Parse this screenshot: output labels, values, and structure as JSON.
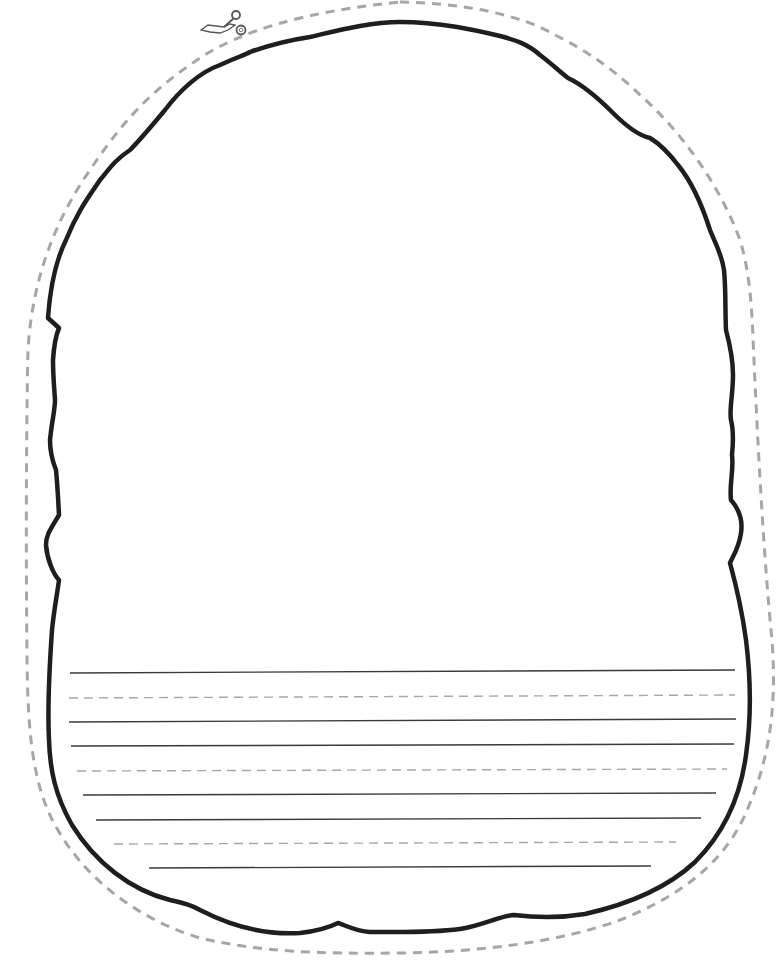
{
  "worksheet": {
    "title": "Cut-out writing template",
    "colors": {
      "background": "#ffffff",
      "outline": "#1e1e1e",
      "cut_line": "#a6a6a6",
      "writing_line_solid": "#3a3a3a",
      "writing_line_dashed": "#a6a6a6"
    },
    "cut_icon": "scissors-icon",
    "writing_lines": [
      {
        "style": "solid",
        "x1": 70,
        "y1": 673,
        "x2": 735,
        "y2": 670
      },
      {
        "style": "dashed",
        "x1": 69,
        "y1": 698,
        "x2": 735,
        "y2": 695
      },
      {
        "style": "solid",
        "x1": 69,
        "y1": 722,
        "x2": 736,
        "y2": 719
      },
      {
        "style": "solid",
        "x1": 71,
        "y1": 746,
        "x2": 734,
        "y2": 744
      },
      {
        "style": "dashed",
        "x1": 77,
        "y1": 771,
        "x2": 727,
        "y2": 769
      },
      {
        "style": "solid",
        "x1": 83,
        "y1": 795,
        "x2": 716,
        "y2": 793
      },
      {
        "style": "solid",
        "x1": 96,
        "y1": 820,
        "x2": 701,
        "y2": 818
      },
      {
        "style": "dashed",
        "x1": 114,
        "y1": 844,
        "x2": 676,
        "y2": 842
      },
      {
        "style": "solid",
        "x1": 149,
        "y1": 868,
        "x2": 651,
        "y2": 866
      }
    ]
  }
}
